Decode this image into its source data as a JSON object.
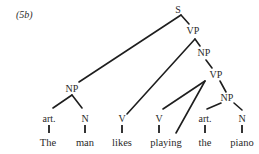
{
  "figure": {
    "label": "(5b)"
  },
  "tree": {
    "root": "S",
    "nodes": {
      "S": "S",
      "vp1": "VP",
      "np_upper": "NP",
      "vp2": "VP",
      "np_subject": "NP",
      "np_object": "NP",
      "art1": "art.",
      "n1": "N",
      "v1": "V",
      "v2": "V",
      "art2": "art.",
      "n2": "N"
    },
    "words": {
      "w1": "The",
      "w2": "man",
      "w3": "likes",
      "w4": "playing",
      "w5": "the",
      "w6": "piano"
    },
    "sentence": "The man likes playing the piano",
    "structure": [
      {
        "parent": "S",
        "children": [
          "NP (subject)",
          "VP"
        ]
      },
      {
        "parent": "NP (subject)",
        "children": [
          "art. — The",
          "N — man"
        ]
      },
      {
        "parent": "VP",
        "children": [
          "V — likes",
          "NP"
        ]
      },
      {
        "parent": "NP",
        "children": [
          "VP"
        ]
      },
      {
        "parent": "VP (lower)",
        "children": [
          "V — playing",
          "playing",
          "NP (object)"
        ]
      },
      {
        "parent": "NP (object)",
        "children": [
          "art. — the",
          "N — piano"
        ]
      }
    ]
  }
}
